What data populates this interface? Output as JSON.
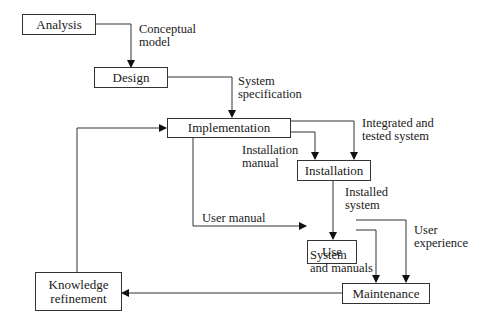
{
  "diagram": {
    "type": "flowchart",
    "nodes": [
      {
        "id": "analysis",
        "label": "Analysis"
      },
      {
        "id": "design",
        "label": "Design"
      },
      {
        "id": "implementation",
        "label": "Implementation"
      },
      {
        "id": "installation",
        "label": "Installation"
      },
      {
        "id": "use",
        "label": "Use"
      },
      {
        "id": "maintenance",
        "label": "Maintenance"
      },
      {
        "id": "knowledge",
        "label": "Knowledge\nrefinement"
      }
    ],
    "edges": [
      {
        "from": "analysis",
        "to": "design",
        "label": "Conceptual\nmodel"
      },
      {
        "from": "design",
        "to": "implementation",
        "label": "System\nspecification"
      },
      {
        "from": "implementation",
        "to": "installation",
        "label": "Installation\nmanual"
      },
      {
        "from": "implementation",
        "to": "installation",
        "label": "Integrated and\ntested system"
      },
      {
        "from": "installation",
        "to": "use",
        "label": "Installed\nsystem"
      },
      {
        "from": "implementation",
        "to": "use",
        "label": "User manual"
      },
      {
        "from": "use",
        "to": "maintenance",
        "label": "System\nand manuals"
      },
      {
        "from": "use",
        "to": "maintenance",
        "label": "User\nexperience"
      },
      {
        "from": "maintenance",
        "to": "knowledge",
        "label": ""
      },
      {
        "from": "knowledge",
        "to": "implementation",
        "label": ""
      }
    ]
  }
}
